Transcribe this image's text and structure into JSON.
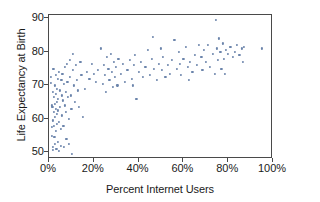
{
  "chart_data": {
    "type": "scatter",
    "title": "",
    "xlabel": "Percent Internet Users",
    "ylabel": "Life Expectancy at Birth",
    "xlim": [
      0,
      100
    ],
    "ylim": [
      48,
      91
    ],
    "grid": false,
    "legend": null,
    "xticks": [
      0,
      20,
      40,
      60,
      80,
      100
    ],
    "xticklabels": [
      "0%",
      "20%",
      "40%",
      "60%",
      "80%",
      "100%"
    ],
    "yticks": [
      50,
      60,
      70,
      80,
      90
    ],
    "yticklabels": [
      "50",
      "60",
      "70",
      "80",
      "90"
    ],
    "marker_color": "#6b84ab",
    "axis_color": "#4a4a4a",
    "points": [
      [
        0.8,
        72.5
      ],
      [
        1.0,
        70.8
      ],
      [
        1.2,
        64.0
      ],
      [
        1.3,
        57.5
      ],
      [
        1.4,
        55.0
      ],
      [
        1.5,
        63.5
      ],
      [
        1.6,
        68.0
      ],
      [
        1.7,
        51.5
      ],
      [
        1.8,
        50.8
      ],
      [
        1.9,
        59.5
      ],
      [
        2.0,
        75.0
      ],
      [
        2.1,
        66.5
      ],
      [
        2.2,
        62.0
      ],
      [
        2.3,
        58.0
      ],
      [
        2.4,
        54.5
      ],
      [
        2.5,
        70.0
      ],
      [
        2.6,
        64.5
      ],
      [
        2.7,
        60.5
      ],
      [
        2.8,
        52.5
      ],
      [
        2.9,
        73.0
      ],
      [
        3.0,
        67.5
      ],
      [
        3.1,
        63.0
      ],
      [
        3.2,
        56.5
      ],
      [
        3.3,
        51.0
      ],
      [
        3.4,
        69.0
      ],
      [
        3.5,
        65.0
      ],
      [
        3.6,
        61.5
      ],
      [
        3.7,
        58.5
      ],
      [
        3.8,
        53.0
      ],
      [
        3.9,
        72.0
      ],
      [
        4.0,
        66.0
      ],
      [
        4.1,
        62.5
      ],
      [
        4.3,
        59.0
      ],
      [
        4.5,
        50.5
      ],
      [
        4.6,
        74.0
      ],
      [
        4.8,
        68.5
      ],
      [
        5.0,
        63.5
      ],
      [
        5.2,
        57.0
      ],
      [
        5.4,
        52.0
      ],
      [
        5.5,
        71.5
      ],
      [
        5.7,
        67.0
      ],
      [
        5.9,
        61.0
      ],
      [
        6.0,
        73.5
      ],
      [
        6.2,
        65.5
      ],
      [
        6.4,
        58.0
      ],
      [
        6.6,
        51.5
      ],
      [
        6.8,
        70.5
      ],
      [
        7.0,
        64.0
      ],
      [
        7.2,
        75.5
      ],
      [
        7.4,
        68.0
      ],
      [
        7.6,
        62.0
      ],
      [
        7.8,
        54.0
      ],
      [
        8.0,
        76.5
      ],
      [
        8.2,
        71.0
      ],
      [
        8.5,
        66.5
      ],
      [
        8.8,
        60.0
      ],
      [
        9.0,
        52.5
      ],
      [
        9.2,
        77.5
      ],
      [
        9.5,
        72.5
      ],
      [
        9.8,
        67.0
      ],
      [
        10.0,
        63.0
      ],
      [
        10.2,
        49.5
      ],
      [
        10.5,
        79.5
      ],
      [
        10.8,
        74.5
      ],
      [
        11.0,
        70.0
      ],
      [
        11.5,
        65.0
      ],
      [
        12.0,
        76.0
      ],
      [
        12.5,
        71.5
      ],
      [
        13.0,
        68.5
      ],
      [
        13.5,
        63.5
      ],
      [
        14.0,
        77.0
      ],
      [
        14.5,
        73.0
      ],
      [
        15.0,
        60.5
      ],
      [
        16.0,
        69.0
      ],
      [
        17.0,
        74.0
      ],
      [
        18.0,
        72.0
      ],
      [
        19.0,
        76.5
      ],
      [
        20.0,
        73.5
      ],
      [
        21.0,
        71.0
      ],
      [
        22.0,
        74.5
      ],
      [
        23.0,
        81.0
      ],
      [
        24.0,
        70.5
      ],
      [
        24.5,
        76.0
      ],
      [
        25.0,
        73.0
      ],
      [
        25.5,
        68.0
      ],
      [
        26.0,
        78.5
      ],
      [
        26.5,
        75.0
      ],
      [
        27.0,
        71.5
      ],
      [
        27.5,
        79.5
      ],
      [
        28.0,
        74.0
      ],
      [
        28.5,
        69.5
      ],
      [
        29.0,
        77.0
      ],
      [
        29.5,
        72.5
      ],
      [
        30.0,
        75.5
      ],
      [
        30.5,
        70.0
      ],
      [
        31.0,
        78.0
      ],
      [
        32.0,
        73.5
      ],
      [
        33.0,
        76.5
      ],
      [
        34.0,
        71.0
      ],
      [
        35.0,
        74.5
      ],
      [
        36.0,
        77.5
      ],
      [
        37.0,
        72.0
      ],
      [
        37.5,
        70.0
      ],
      [
        38.0,
        76.0
      ],
      [
        38.5,
        79.0
      ],
      [
        39.0,
        66.0
      ],
      [
        40.0,
        74.0
      ],
      [
        41.0,
        77.0
      ],
      [
        42.0,
        72.5
      ],
      [
        43.0,
        75.5
      ],
      [
        44.0,
        80.5
      ],
      [
        45.0,
        73.0
      ],
      [
        46.0,
        78.0
      ],
      [
        46.5,
        84.5
      ],
      [
        47.0,
        75.0
      ],
      [
        48.0,
        71.5
      ],
      [
        49.0,
        76.5
      ],
      [
        50.0,
        81.0
      ],
      [
        50.5,
        74.5
      ],
      [
        51.0,
        78.5
      ],
      [
        52.0,
        72.5
      ],
      [
        53.0,
        76.0
      ],
      [
        54.0,
        73.5
      ],
      [
        55.0,
        77.5
      ],
      [
        56.0,
        83.5
      ],
      [
        57.0,
        75.0
      ],
      [
        58.0,
        80.0
      ],
      [
        58.5,
        76.5
      ],
      [
        59.0,
        73.0
      ],
      [
        60.0,
        78.0
      ],
      [
        61.0,
        81.5
      ],
      [
        62.0,
        75.5
      ],
      [
        62.5,
        71.5
      ],
      [
        63.0,
        77.0
      ],
      [
        64.0,
        74.0
      ],
      [
        65.0,
        79.0
      ],
      [
        66.0,
        76.0
      ],
      [
        67.0,
        82.0
      ],
      [
        68.0,
        78.5
      ],
      [
        68.5,
        74.5
      ],
      [
        69.0,
        80.5
      ],
      [
        70.0,
        77.0
      ],
      [
        71.0,
        82.0
      ],
      [
        72.0,
        75.5
      ],
      [
        73.0,
        79.5
      ],
      [
        74.0,
        73.5
      ],
      [
        74.5,
        89.5
      ],
      [
        75.0,
        81.0
      ],
      [
        75.5,
        77.5
      ],
      [
        76.0,
        84.0
      ],
      [
        76.5,
        80.0
      ],
      [
        77.0,
        75.0
      ],
      [
        77.5,
        82.5
      ],
      [
        78.0,
        78.0
      ],
      [
        78.5,
        73.5
      ],
      [
        79.0,
        80.5
      ],
      [
        80.0,
        79.5
      ],
      [
        81.0,
        81.5
      ],
      [
        82.0,
        78.5
      ],
      [
        83.0,
        80.0
      ],
      [
        84.0,
        82.0
      ],
      [
        85.0,
        79.0
      ],
      [
        86.0,
        81.0
      ],
      [
        86.5,
        77.0
      ],
      [
        87.0,
        81.5
      ],
      [
        95.0,
        81.0
      ]
    ]
  }
}
